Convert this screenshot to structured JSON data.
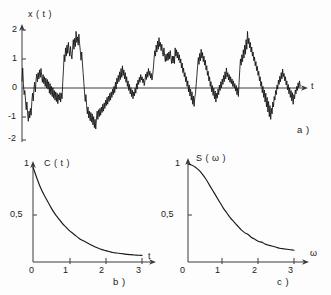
{
  "figure": {
    "caption_tags": [
      "a )",
      "b )",
      "c )"
    ],
    "background_color": "#fdfdfd",
    "ink_color": "#1a1a1a"
  },
  "chart_data": [
    {
      "type": "line",
      "id": "panel-a-time-series",
      "tag": "a )",
      "title": "",
      "ylabel": "x ( t )",
      "xlabel": "t",
      "xlim": [
        0,
        100
      ],
      "ylim": [
        -2,
        2.3
      ],
      "yticks": [
        2,
        1,
        0,
        -1,
        -2
      ],
      "ytick_labels": [
        "2",
        "1",
        "0",
        "-1",
        "-2"
      ],
      "xticks": [],
      "xtick_labels": [],
      "grid": false,
      "legend": "none",
      "description": "Realisation of a stationary random process x(t); dense zero-mean noise fluctuating between about -2 and +2",
      "x": [
        0,
        0.25,
        0.5,
        0.75,
        1,
        1.25,
        1.5,
        1.75,
        2,
        2.25,
        2.5,
        2.75,
        3,
        3.25,
        3.5,
        3.75,
        4,
        4.25,
        4.5,
        4.75,
        5,
        5.25,
        5.5,
        5.75,
        6,
        6.25,
        6.5,
        6.75,
        7,
        7.25,
        7.5,
        7.75,
        8,
        8.25,
        8.5,
        8.75,
        9,
        9.25,
        9.5,
        9.75,
        10,
        10.25,
        10.5,
        10.75,
        11,
        11.25,
        11.5,
        11.75,
        12,
        12.25,
        12.5,
        12.75,
        13,
        13.25,
        13.5,
        13.75,
        14,
        14.25,
        14.5,
        14.75,
        15,
        15.25,
        15.5,
        15.75,
        16,
        16.25,
        16.5,
        16.75,
        17,
        17.25,
        17.5,
        17.75,
        18,
        18.25,
        18.5,
        18.75,
        19,
        19.25,
        19.5,
        19.75,
        20,
        20.25,
        20.5,
        20.75,
        21,
        21.25,
        21.5,
        21.75,
        22,
        22.25,
        22.5,
        22.75,
        23,
        23.25,
        23.5,
        23.75,
        24,
        24.25,
        24.5,
        24.75,
        25,
        25.25,
        25.5,
        25.75,
        26,
        26.25,
        26.5,
        26.75,
        27,
        27.25,
        27.5,
        27.75,
        28,
        28.25,
        28.5,
        28.75,
        29,
        29.25,
        29.5,
        29.75,
        30,
        30.25,
        30.5,
        30.75,
        31,
        31.25,
        31.5,
        31.75,
        32,
        32.25,
        32.5,
        32.75,
        33,
        33.25,
        33.5,
        33.75,
        34,
        34.25,
        34.5,
        34.75,
        35,
        35.25,
        35.5,
        35.75,
        36,
        36.25,
        36.5,
        36.75,
        37,
        37.25,
        37.5,
        37.75,
        38,
        38.25,
        38.5,
        38.75,
        39,
        39.25,
        39.5,
        39.75,
        40,
        40.25,
        40.5,
        40.75,
        41,
        41.25,
        41.5,
        41.75,
        42,
        42.25,
        42.5,
        42.75,
        43,
        43.25,
        43.5,
        43.75,
        44,
        44.25,
        44.5,
        44.75,
        45,
        45.25,
        45.5,
        45.75,
        46,
        46.25,
        46.5,
        46.75,
        47,
        47.25,
        47.5,
        47.75,
        48,
        48.25,
        48.5,
        48.75,
        49,
        49.25,
        49.5,
        49.75,
        50,
        50.25,
        50.5,
        50.75,
        51,
        51.25,
        51.5,
        51.75,
        52,
        52.25,
        52.5,
        52.75,
        53,
        53.25,
        53.5,
        53.75,
        54,
        54.25,
        54.5,
        54.75,
        55,
        55.25,
        55.5,
        55.75,
        56,
        56.25,
        56.5,
        56.75,
        57,
        57.25,
        57.5,
        57.75,
        58,
        58.25,
        58.5,
        58.75,
        59,
        59.25,
        59.5,
        59.75,
        60,
        60.25,
        60.5,
        60.75,
        61,
        61.25,
        61.5,
        61.75,
        62,
        62.25,
        62.5,
        62.75,
        63,
        63.25,
        63.5,
        63.75,
        64,
        64.25,
        64.5,
        64.75,
        65,
        65.25,
        65.5,
        65.75,
        66,
        66.25,
        66.5,
        66.75,
        67,
        67.25,
        67.5,
        67.75,
        68,
        68.25,
        68.5,
        68.75,
        69,
        69.25,
        69.5,
        69.75,
        70,
        70.25,
        70.5,
        70.75,
        71,
        71.25,
        71.5,
        71.75,
        72,
        72.25,
        72.5,
        72.75,
        73,
        73.25,
        73.5,
        73.75,
        74,
        74.25,
        74.5,
        74.75,
        75,
        75.25,
        75.5,
        75.75,
        76,
        76.25,
        76.5,
        76.75,
        77,
        77.25,
        77.5,
        77.75,
        78,
        78.25,
        78.5,
        78.75,
        79,
        79.25,
        79.5,
        79.75,
        80,
        80.25,
        80.5,
        80.75,
        81,
        81.25,
        81.5,
        81.75,
        82,
        82.25,
        82.5,
        82.75,
        83,
        83.25,
        83.5,
        83.75,
        84,
        84.25,
        84.5,
        84.75,
        85,
        85.25,
        85.5,
        85.75,
        86,
        86.25,
        86.5,
        86.75,
        87,
        87.25,
        87.5,
        87.75,
        88,
        88.25,
        88.5,
        88.75,
        89,
        89.25,
        89.5,
        89.75,
        90,
        90.25,
        90.5,
        90.75,
        91,
        91.25,
        91.5,
        91.75,
        92,
        92.25,
        92.5,
        92.75,
        93,
        93.25,
        93.5,
        93.75,
        94,
        94.25,
        94.5,
        94.75,
        95,
        95.25,
        95.5,
        95.75,
        96,
        96.25,
        96.5,
        96.75,
        97,
        97.25,
        97.5,
        97.75,
        98,
        98.25,
        98.5,
        98.75,
        99,
        99.25,
        99.5,
        99.75,
        100
      ],
      "values": [
        0.15,
        0.62,
        0.05,
        -0.35,
        -0.2,
        -0.55,
        -0.9,
        -0.62,
        -1.05,
        -1.32,
        -0.95,
        -1.2,
        -0.85,
        -1.1,
        -0.6,
        -0.3,
        -0.58,
        -0.15,
        0.1,
        -0.25,
        0.18,
        0.4,
        0.12,
        0.45,
        0.22,
        0.55,
        0.28,
        0.6,
        0.35,
        0.1,
        0.38,
        0.05,
        0.3,
        -0.05,
        0.25,
        -0.1,
        0.2,
        -0.15,
        0.12,
        -0.3,
        0.05,
        -0.35,
        -0.05,
        -0.42,
        -0.1,
        -0.48,
        -0.2,
        -0.55,
        -0.25,
        -0.6,
        -0.3,
        -0.68,
        -0.35,
        -0.55,
        -0.28,
        -0.62,
        -0.3,
        -0.5,
        0.1,
        0.55,
        1.1,
        0.85,
        1.35,
        1.05,
        1.45,
        1.15,
        1.55,
        1.25,
        1.05,
        1.4,
        1.12,
        0.95,
        1.3,
        1.65,
        1.3,
        1.7,
        1.4,
        1.95,
        1.55,
        1.75,
        1.45,
        1.85,
        1.5,
        1.25,
        0.9,
        1.2,
        0.8,
        0.45,
        0.1,
        -0.25,
        -0.6,
        -0.35,
        -0.75,
        -1.05,
        -0.8,
        -1.2,
        -0.95,
        -1.3,
        -1.0,
        -1.35,
        -1.05,
        -1.45,
        -1.15,
        -1.55,
        -1.25,
        -1.6,
        -1.2,
        -0.95,
        -1.25,
        -0.9,
        -1.15,
        -0.85,
        -1.1,
        -0.8,
        -1.0,
        -0.7,
        -0.95,
        -0.65,
        -0.85,
        -0.55,
        -0.75,
        -0.45,
        -0.7,
        -0.4,
        -0.6,
        -0.3,
        -0.55,
        -0.25,
        -0.45,
        -0.15,
        -0.35,
        -0.05,
        -0.28,
        0.1,
        -0.15,
        0.25,
        0.05,
        0.35,
        0.12,
        0.48,
        0.2,
        0.6,
        0.28,
        0.7,
        0.35,
        0.55,
        0.22,
        0.45,
        0.1,
        0.3,
        -0.05,
        0.15,
        -0.2,
        0.02,
        -0.32,
        -0.1,
        -0.42,
        -0.18,
        -0.5,
        -0.25,
        -0.4,
        -0.12,
        -0.3,
        0.05,
        -0.15,
        0.18,
        0.02,
        0.28,
        0.1,
        0.38,
        0.18,
        0.3,
        0.08,
        0.22,
        -0.02,
        0.15,
        0.4,
        0.2,
        0.48,
        0.28,
        0.6,
        0.35,
        0.5,
        0.25,
        0.42,
        0.18,
        0.35,
        0.62,
        0.95,
        1.25,
        1.05,
        1.45,
        1.2,
        1.6,
        1.3,
        1.72,
        1.4,
        1.55,
        1.25,
        1.48,
        1.18,
        1.05,
        1.35,
        1.08,
        0.85,
        1.12,
        0.88,
        1.15,
        0.9,
        1.2,
        0.95,
        1.25,
        1.0,
        0.78,
        1.05,
        0.8,
        1.05,
        0.78,
        1.35,
        1.05,
        1.28,
        0.98,
        1.2,
        0.9,
        1.1,
        0.8,
        0.95,
        0.62,
        0.8,
        0.45,
        0.62,
        0.3,
        0.45,
        0.12,
        0.3,
        -0.05,
        0.15,
        -0.25,
        0.0,
        -0.4,
        -0.15,
        -0.55,
        -0.25,
        -0.7,
        -0.4,
        -0.78,
        -0.45,
        -0.3,
        0.05,
        0.35,
        0.7,
        1.0,
        0.75,
        1.15,
        0.88,
        1.3,
        0.98,
        1.18,
        0.85,
        1.05,
        0.72,
        0.9,
        0.55,
        0.7,
        0.35,
        0.5,
        0.15,
        0.3,
        -0.05,
        0.12,
        -0.25,
        -0.02,
        -0.38,
        -0.12,
        -0.5,
        -0.22,
        -0.62,
        -0.3,
        -0.48,
        -0.15,
        -0.35,
        0.0,
        -0.2,
        0.12,
        -0.1,
        0.22,
        0.02,
        0.35,
        0.12,
        0.48,
        0.22,
        0.62,
        0.3,
        0.45,
        0.18,
        0.38,
        0.1,
        0.3,
        0.05,
        0.22,
        -0.05,
        0.15,
        -0.1,
        0.05,
        -0.22,
        -0.02,
        -0.35,
        -0.12,
        -0.42,
        0.1,
        0.55,
        0.95,
        0.72,
        1.1,
        0.85,
        1.28,
        0.98,
        1.45,
        1.12,
        1.65,
        1.3,
        1.95,
        1.5,
        1.7,
        1.35,
        1.55,
        1.2,
        1.38,
        1.05,
        1.2,
        0.88,
        1.02,
        0.7,
        0.85,
        0.52,
        0.68,
        0.35,
        0.5,
        0.15,
        0.3,
        -0.05,
        0.12,
        -0.28,
        -0.05,
        -0.45,
        -0.18,
        -0.62,
        -0.3,
        -0.8,
        -0.45,
        -0.98,
        -0.6,
        -1.15,
        -0.75,
        -1.25,
        -0.85,
        -1.05,
        -0.62,
        -0.8,
        -0.42,
        -0.55,
        -0.2,
        -0.35,
        0.0,
        -0.15,
        0.18,
        0.02,
        0.32,
        0.12,
        0.45,
        0.22,
        0.58,
        0.3,
        0.42,
        0.15,
        0.3,
        0.0,
        0.15,
        -0.18,
        0.02,
        -0.32,
        -0.1,
        -0.45,
        -0.2,
        -0.58,
        -0.28,
        -0.7,
        -0.35,
        -0.5,
        -0.18,
        -0.32,
        -0.05,
        -0.2,
        0.08,
        -0.1,
        0.15,
        -0.05
      ]
    },
    {
      "type": "line",
      "id": "panel-b-correlation",
      "tag": "b )",
      "title": "",
      "ylabel": "C ( t )",
      "xlabel": "t",
      "xlim": [
        0,
        3.25
      ],
      "ylim": [
        0,
        1.12
      ],
      "xticks": [
        0,
        1,
        2,
        3
      ],
      "xtick_labels": [
        "0",
        "1",
        "2",
        "3"
      ],
      "yticks": [
        0.5,
        1
      ],
      "ytick_labels": [
        "0,5",
        "1"
      ],
      "grid": false,
      "legend": "none",
      "description": "Autocorrelation function C(t) = exp(-t/tau), monotonically decaying from 1 at t=0 towards 0",
      "x": [
        0,
        0.1,
        0.2,
        0.3,
        0.4,
        0.5,
        0.6,
        0.7,
        0.8,
        0.9,
        1.0,
        1.1,
        1.2,
        1.3,
        1.4,
        1.5,
        1.6,
        1.7,
        1.8,
        1.9,
        2.0,
        2.1,
        2.2,
        2.3,
        2.4,
        2.5,
        2.6,
        2.7,
        2.8,
        2.9,
        3.0
      ],
      "values": [
        1.0,
        0.89,
        0.79,
        0.71,
        0.64,
        0.57,
        0.51,
        0.46,
        0.41,
        0.37,
        0.33,
        0.3,
        0.27,
        0.24,
        0.22,
        0.2,
        0.18,
        0.16,
        0.145,
        0.13,
        0.12,
        0.11,
        0.1,
        0.095,
        0.09,
        0.085,
        0.08,
        0.077,
        0.074,
        0.071,
        0.07
      ]
    },
    {
      "type": "line",
      "id": "panel-c-spectral-density",
      "tag": "c )",
      "title": "",
      "ylabel": "S ( ω )",
      "xlabel": "ω",
      "xlim": [
        0,
        3.25
      ],
      "ylim": [
        0,
        1.12
      ],
      "xticks": [
        0,
        1,
        2,
        3
      ],
      "xtick_labels": [
        "0",
        "1",
        "2",
        "3"
      ],
      "yticks": [
        0.5,
        1
      ],
      "ytick_labels": [
        "0,5",
        "1"
      ],
      "grid": false,
      "legend": "none",
      "description": "Spectral density S(omega), Lorentzian-like low-pass shape falling from 1 at omega=0 to about 0.1 at omega=3",
      "x": [
        0,
        0.1,
        0.2,
        0.3,
        0.4,
        0.5,
        0.6,
        0.7,
        0.8,
        0.9,
        1.0,
        1.1,
        1.2,
        1.3,
        1.4,
        1.5,
        1.6,
        1.7,
        1.8,
        1.9,
        2.0,
        2.1,
        2.2,
        2.3,
        2.4,
        2.5,
        2.6,
        2.7,
        2.8,
        2.9,
        3.0
      ],
      "values": [
        1.0,
        0.99,
        0.97,
        0.94,
        0.9,
        0.85,
        0.79,
        0.73,
        0.67,
        0.61,
        0.55,
        0.5,
        0.45,
        0.41,
        0.37,
        0.33,
        0.3,
        0.28,
        0.25,
        0.23,
        0.21,
        0.2,
        0.18,
        0.17,
        0.16,
        0.15,
        0.14,
        0.135,
        0.13,
        0.125,
        0.12
      ]
    }
  ]
}
